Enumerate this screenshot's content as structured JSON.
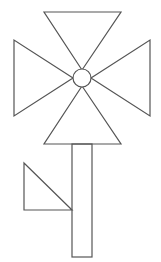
{
  "figure": {
    "stroke_color": "#555555",
    "background_color": "#ffffff",
    "shapes": {
      "petal_top": {
        "type": "triangle",
        "points": [
          [
            44,
            12
          ],
          [
            121,
            12
          ],
          [
            82,
            70
          ]
        ]
      },
      "petal_left": {
        "type": "triangle",
        "points": [
          [
            14,
            40
          ],
          [
            14,
            116
          ],
          [
            73,
            78
          ]
        ]
      },
      "petal_right": {
        "type": "triangle",
        "points": [
          [
            150,
            40
          ],
          [
            150,
            116
          ],
          [
            91,
            78
          ]
        ]
      },
      "petal_bottom": {
        "type": "triangle",
        "points": [
          [
            82,
            86
          ],
          [
            121,
            144
          ],
          [
            44,
            144
          ]
        ]
      },
      "center": {
        "type": "circle",
        "cx": 82,
        "cy": 78,
        "r": 9
      },
      "stem": {
        "type": "rectangle",
        "x": 72,
        "y": 144,
        "width": 20,
        "height": 113
      },
      "leaf": {
        "type": "triangle",
        "points": [
          [
            24,
            163
          ],
          [
            24,
            210
          ],
          [
            72,
            210
          ]
        ]
      }
    }
  }
}
